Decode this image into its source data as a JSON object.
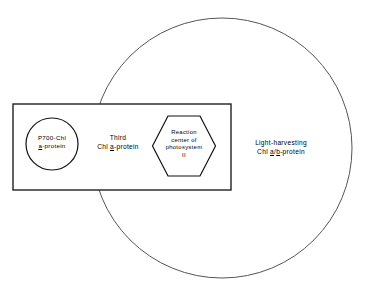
{
  "figure": {
    "background_color": "#ffffff",
    "stroke_color": "#1a1a1a",
    "circle_stroke_color": "#4d4d4d",
    "width": 370,
    "height": 292
  },
  "shapes": {
    "outer_circle": {
      "name": "light-harvesting-complex-circle",
      "cx": 222,
      "cy": 148,
      "r": 130,
      "stroke": "#555555",
      "stroke_width": 1
    },
    "rectangle": {
      "name": "membrane-rectangle",
      "x": 13,
      "y": 104,
      "width": 218,
      "height": 86,
      "stroke": "#222222",
      "stroke_width": 1.4
    },
    "inner_circle": {
      "name": "p700-chl-a-protein-circle",
      "cx": 52,
      "cy": 144,
      "r": 26,
      "stroke": "#111111",
      "stroke_width": 1.2
    },
    "hexagon": {
      "name": "reaction-center-hexagon",
      "cx": 184,
      "cy": 146,
      "width": 63,
      "height": 61,
      "stroke": "#111111",
      "stroke_width": 1.2
    }
  },
  "labels": {
    "p700": {
      "line1": "P700-Chl",
      "line2_prefix": "",
      "line2_underlined": "a",
      "line2_suffix": "-protein"
    },
    "third": {
      "line1": "Third",
      "line2_prefix": "Chl ",
      "line2_underlined": "a",
      "line2_suffix": "-protein"
    },
    "reaction_center": {
      "line1": "Reaction",
      "line2": "center of",
      "line3": "photosystem",
      "line4": "II"
    },
    "light_harvesting": {
      "line1": "Light-harvesting",
      "line2_prefix": "Chl ",
      "line2_underlined_a": "a",
      "line2_separator": "/",
      "line2_underlined_b": "b",
      "line2_suffix": "-protein"
    }
  }
}
